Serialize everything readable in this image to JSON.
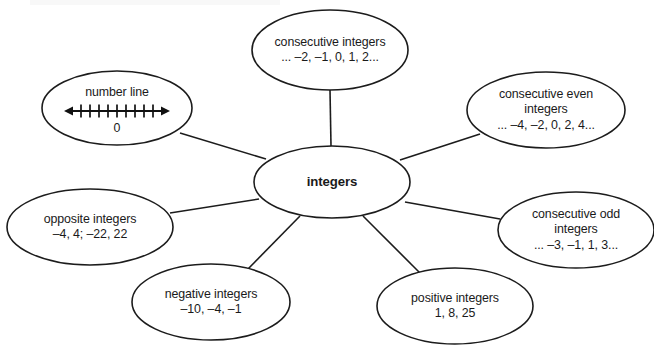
{
  "diagram": {
    "type": "concept-map",
    "title": "integers",
    "center": {
      "id": "integers",
      "label": "integers",
      "bold": true,
      "cx": 332,
      "cy": 182,
      "rx": 78,
      "ry": 36
    },
    "nodes": [
      {
        "id": "number-line",
        "lines": [
          "number line",
          "0"
        ],
        "has_number_line_graphic": true,
        "tick_count": 9,
        "zero_label": "0",
        "cx": 117,
        "cy": 108,
        "rx": 75,
        "ry": 37
      },
      {
        "id": "consecutive-integers",
        "lines": [
          "consecutive integers",
          "... –2, –1, 0, 1, 2..."
        ],
        "has_number_line_graphic": false,
        "cx": 330,
        "cy": 50,
        "rx": 78,
        "ry": 40
      },
      {
        "id": "consecutive-even-integers",
        "lines": [
          "consecutive even",
          "integers",
          "... –4, –2, 0, 2, 4..."
        ],
        "has_number_line_graphic": false,
        "cx": 546,
        "cy": 110,
        "rx": 79,
        "ry": 38
      },
      {
        "id": "consecutive-odd-integers",
        "lines": [
          "consecutive odd",
          "integers",
          "... –3, –1, 1, 3..."
        ],
        "has_number_line_graphic": false,
        "cx": 576,
        "cy": 230,
        "rx": 78,
        "ry": 38
      },
      {
        "id": "positive-integers",
        "lines": [
          "positive integers",
          "1, 8, 25"
        ],
        "has_number_line_graphic": false,
        "cx": 455,
        "cy": 306,
        "rx": 78,
        "ry": 38
      },
      {
        "id": "negative-integers",
        "lines": [
          "negative integers",
          "–10, –4, –1"
        ],
        "has_number_line_graphic": false,
        "cx": 211,
        "cy": 302,
        "rx": 79,
        "ry": 38
      },
      {
        "id": "opposite-integers",
        "lines": [
          "opposite integers",
          "–4, 4; –22, 22"
        ],
        "has_number_line_graphic": false,
        "cx": 90,
        "cy": 227,
        "rx": 83,
        "ry": 38
      }
    ],
    "connectors": [
      {
        "id": "link-center-consecutive-integers",
        "from": "integers",
        "to": "consecutive-integers",
        "x1": 331,
        "y1": 146,
        "x2": 330,
        "y2": 90
      },
      {
        "id": "link-center-number-line",
        "from": "integers",
        "to": "number-line",
        "x1": 266,
        "y1": 159,
        "x2": 180,
        "y2": 133
      },
      {
        "id": "link-center-consecutive-even",
        "from": "integers",
        "to": "consecutive-even-integers",
        "x1": 400,
        "y1": 160,
        "x2": 480,
        "y2": 134
      },
      {
        "id": "link-center-consecutive-odd",
        "from": "integers",
        "to": "consecutive-odd-integers",
        "x1": 405,
        "y1": 202,
        "x2": 500,
        "y2": 219
      },
      {
        "id": "link-center-positive",
        "from": "integers",
        "to": "positive-integers",
        "x1": 363,
        "y1": 216,
        "x2": 421,
        "y2": 274
      },
      {
        "id": "link-center-negative",
        "from": "integers",
        "to": "negative-integers",
        "x1": 300,
        "y1": 216,
        "x2": 247,
        "y2": 270
      },
      {
        "id": "link-center-opposite",
        "from": "integers",
        "to": "opposite-integers",
        "x1": 259,
        "y1": 199,
        "x2": 170,
        "y2": 213
      }
    ],
    "colors": {
      "stroke": "#1c1c1c",
      "text": "#1a1a1a",
      "background": "#ffffff"
    }
  }
}
